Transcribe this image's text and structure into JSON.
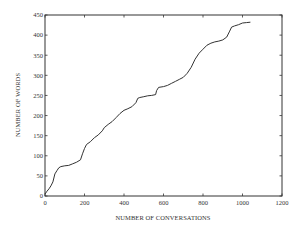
{
  "chart_data": {
    "type": "line",
    "title": "",
    "xlabel": "NUMBER OF CONVERSATIONS",
    "ylabel": "NUMBER OF WORDS",
    "xlim": [
      0,
      1200
    ],
    "ylim": [
      0,
      450
    ],
    "xticks": [
      0,
      200,
      400,
      600,
      800,
      1000,
      1200
    ],
    "yticks": [
      0,
      50,
      100,
      150,
      200,
      250,
      300,
      350,
      400,
      450
    ],
    "grid": false,
    "legend": null,
    "line_color": "#333333",
    "series": [
      {
        "name": "words vs conversations",
        "x": [
          0,
          10,
          20,
          30,
          40,
          50,
          60,
          70,
          80,
          100,
          120,
          140,
          160,
          180,
          190,
          200,
          210,
          230,
          250,
          270,
          290,
          300,
          320,
          340,
          360,
          380,
          400,
          420,
          440,
          460,
          470,
          480,
          500,
          520,
          540,
          560,
          565,
          575,
          600,
          620,
          640,
          660,
          680,
          700,
          720,
          740,
          760,
          780,
          800,
          820,
          840,
          860,
          880,
          900,
          920,
          935,
          945,
          960,
          980,
          1000,
          1020,
          1040
        ],
        "y": [
          5,
          12,
          18,
          25,
          35,
          55,
          63,
          70,
          73,
          75,
          76,
          80,
          84,
          90,
          105,
          118,
          128,
          135,
          145,
          152,
          162,
          170,
          178,
          185,
          195,
          205,
          213,
          217,
          222,
          232,
          243,
          245,
          247,
          249,
          250,
          252,
          262,
          270,
          272,
          275,
          280,
          285,
          290,
          295,
          305,
          320,
          340,
          355,
          365,
          375,
          380,
          383,
          385,
          388,
          395,
          410,
          420,
          423,
          426,
          430,
          431,
          432
        ]
      }
    ]
  }
}
